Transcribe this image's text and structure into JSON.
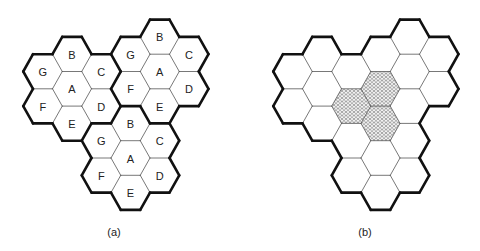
{
  "figure": {
    "hex_side_px": 19.5,
    "hex_height_px": 34.6,
    "line_colors": {
      "thick": "#111111",
      "thin": "#555555",
      "fill": "#ffffff",
      "hatch": "#777777"
    },
    "cell_offsets": {
      "A": [
        0,
        0
      ],
      "B": [
        0,
        -1
      ],
      "C": [
        1,
        -1
      ],
      "D": [
        1,
        0
      ],
      "E": [
        0,
        1
      ],
      "F": [
        -1,
        1
      ],
      "G": [
        -1,
        0
      ]
    },
    "cluster_centers_axial": [
      [
        0,
        0
      ],
      [
        3,
        -2
      ],
      [
        2,
        1
      ]
    ],
    "panels": [
      {
        "id": "a",
        "caption": "(a)",
        "origin": [
          72,
          88.8
        ],
        "caption_pos": [
          114,
          232
        ],
        "show_labels": true,
        "thick_cluster_borders": true,
        "hatched_cells": []
      },
      {
        "id": "b",
        "caption": "(b)",
        "origin": [
          322,
          88.8
        ],
        "caption_pos": [
          365,
          232
        ],
        "show_labels": false,
        "thick_cluster_borders": false,
        "hatched_cells": [
          {
            "cluster": 0,
            "cell": "D"
          },
          {
            "cluster": 1,
            "cell": "F"
          },
          {
            "cluster": 2,
            "cell": "B"
          }
        ]
      }
    ]
  }
}
